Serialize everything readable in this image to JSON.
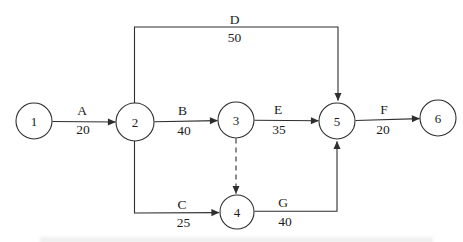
{
  "diagram": {
    "kind": "activity-on-arrow network diagram",
    "background_color": "#ffffff",
    "line_color": "#2e2e2e",
    "text_color": "#1c1c1c",
    "node_font_size": 13,
    "label_font_size": 13.5,
    "nodes": [
      {
        "id": "1",
        "label": "1",
        "x": 34,
        "y": 121,
        "r": 18
      },
      {
        "id": "2",
        "label": "2",
        "x": 135,
        "y": 122,
        "r": 19
      },
      {
        "id": "3",
        "label": "3",
        "x": 236,
        "y": 120,
        "r": 18
      },
      {
        "id": "4",
        "label": "4",
        "x": 237,
        "y": 212,
        "r": 17
      },
      {
        "id": "5",
        "label": "5",
        "x": 337,
        "y": 121,
        "r": 18
      },
      {
        "id": "6",
        "label": "6",
        "x": 438,
        "y": 118,
        "r": 18
      }
    ],
    "edges": [
      {
        "id": "A",
        "label": "A",
        "value": "20",
        "from": "1",
        "to": "2",
        "type": "activity",
        "points": [
          [
            52.5,
            121.5
          ],
          [
            115.5,
            122
          ]
        ],
        "label_x": 82,
        "label_y": 114.5,
        "value_x": 83,
        "value_y": 134
      },
      {
        "id": "B",
        "label": "B",
        "value": "40",
        "from": "2",
        "to": "3",
        "type": "activity",
        "points": [
          [
            154.5,
            121.8
          ],
          [
            217.5,
            120.6
          ]
        ],
        "label_x": 182.5,
        "label_y": 114.5,
        "value_x": 184,
        "value_y": 134.5
      },
      {
        "id": "E",
        "label": "E",
        "value": "35",
        "from": "3",
        "to": "5",
        "type": "activity",
        "points": [
          [
            254.5,
            120.2
          ],
          [
            318.5,
            120.8
          ]
        ],
        "label_x": 278,
        "label_y": 114,
        "value_x": 279,
        "value_y": 133.5
      },
      {
        "id": "F",
        "label": "F",
        "value": "20",
        "from": "5",
        "to": "6",
        "type": "activity",
        "points": [
          [
            355.5,
            120.5
          ],
          [
            419.5,
            118.6
          ]
        ],
        "label_x": 384,
        "label_y": 114,
        "value_x": 383,
        "value_y": 134
      },
      {
        "id": "D",
        "label": "D",
        "value": "50",
        "from": "2",
        "to": "5",
        "type": "activity",
        "points": [
          [
            134.5,
            103.5
          ],
          [
            134.5,
            27
          ],
          [
            338,
            27
          ],
          [
            338,
            100.5
          ]
        ],
        "label_x": 234.5,
        "label_y": 23.5,
        "value_x": 234.5,
        "value_y": 42
      },
      {
        "id": "C",
        "label": "C",
        "value": "25",
        "from": "2",
        "to": "4",
        "type": "activity",
        "points": [
          [
            134.5,
            141
          ],
          [
            134.5,
            213
          ],
          [
            219,
            212.6
          ]
        ],
        "label_x": 182,
        "label_y": 208.5,
        "value_x": 183.5,
        "value_y": 227
      },
      {
        "id": "G",
        "label": "G",
        "value": "40",
        "from": "4",
        "to": "5",
        "type": "activity",
        "points": [
          [
            254.5,
            211.2
          ],
          [
            337,
            211.2
          ],
          [
            337,
            141.5
          ]
        ],
        "label_x": 283,
        "label_y": 207,
        "value_x": 285,
        "value_y": 225.5
      },
      {
        "id": "dummy-3-4",
        "label": "",
        "value": "",
        "from": "3",
        "to": "4",
        "type": "dummy",
        "points": [
          [
            236,
            138.5
          ],
          [
            236,
            193.5
          ]
        ]
      }
    ]
  }
}
